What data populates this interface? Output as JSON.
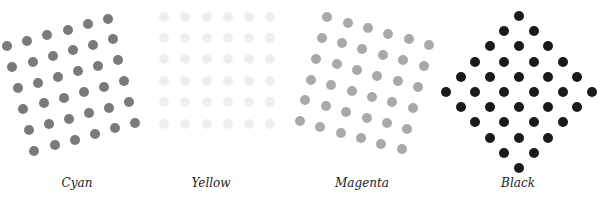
{
  "panels": [
    {
      "name": "cyan",
      "label": "Cyan",
      "color": "#7a7a7a",
      "label_x": 77,
      "dots": [
        [
          7,
          46
        ],
        [
          27,
          41
        ],
        [
          47,
          35
        ],
        [
          68,
          30
        ],
        [
          88,
          24
        ],
        [
          108,
          19
        ],
        [
          12,
          67
        ],
        [
          33,
          62
        ],
        [
          53,
          56
        ],
        [
          73,
          50
        ],
        [
          93,
          45
        ],
        [
          113,
          39
        ],
        [
          18,
          88
        ],
        [
          38,
          83
        ],
        [
          58,
          77
        ],
        [
          78,
          71
        ],
        [
          98,
          66
        ],
        [
          118,
          60
        ],
        [
          23,
          109
        ],
        [
          44,
          103
        ],
        [
          64,
          98
        ],
        [
          84,
          92
        ],
        [
          104,
          87
        ],
        [
          124,
          81
        ],
        [
          29,
          130
        ],
        [
          49,
          124
        ],
        [
          69,
          119
        ],
        [
          89,
          113
        ],
        [
          109,
          108
        ],
        [
          129,
          102
        ],
        [
          34,
          151
        ],
        [
          55,
          145
        ],
        [
          75,
          140
        ],
        [
          95,
          134
        ],
        [
          115,
          128
        ],
        [
          135,
          123
        ]
      ]
    },
    {
      "name": "yellow",
      "label": "Yellow",
      "color": "#efefef",
      "label_x": 211,
      "grid": {
        "xs": [
          164,
          185,
          207,
          228,
          249,
          270
        ],
        "ys": [
          17,
          38,
          59,
          81,
          102,
          124
        ]
      }
    },
    {
      "name": "magenta",
      "label": "Magenta",
      "color": "#a9a9a9",
      "label_x": 362,
      "dots": [
        [
          327,
          17
        ],
        [
          348,
          23
        ],
        [
          368,
          28
        ],
        [
          388,
          34
        ],
        [
          409,
          39
        ],
        [
          429,
          45
        ],
        [
          322,
          38
        ],
        [
          342,
          43
        ],
        [
          362,
          49
        ],
        [
          383,
          55
        ],
        [
          403,
          60
        ],
        [
          424,
          66
        ],
        [
          316,
          59
        ],
        [
          337,
          64
        ],
        [
          357,
          70
        ],
        [
          377,
          76
        ],
        [
          398,
          81
        ],
        [
          418,
          87
        ],
        [
          311,
          80
        ],
        [
          331,
          85
        ],
        [
          352,
          91
        ],
        [
          372,
          97
        ],
        [
          392,
          102
        ],
        [
          413,
          108
        ],
        [
          305,
          100
        ],
        [
          326,
          106
        ],
        [
          346,
          112
        ],
        [
          367,
          118
        ],
        [
          387,
          123
        ],
        [
          407,
          129
        ],
        [
          300,
          121
        ],
        [
          320,
          127
        ],
        [
          341,
          133
        ],
        [
          361,
          138
        ],
        [
          381,
          144
        ],
        [
          402,
          149
        ]
      ]
    },
    {
      "name": "black",
      "label": "Black",
      "color": "#1a1a1a",
      "label_x": 518,
      "diamond": {
        "cx": 519,
        "cy": 92,
        "dx": 14.6,
        "dy": 15.2,
        "n": 5
      }
    }
  ]
}
